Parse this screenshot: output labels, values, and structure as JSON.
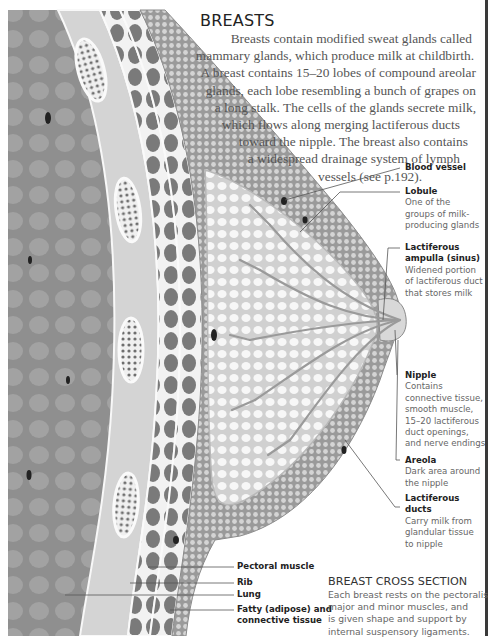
{
  "header": {
    "title": "BREASTS",
    "intro_lines": [
      "Breasts contain modified sweat glands called",
      "mammary glands, which produce milk at childbirth.",
      "A breast contains 15–20 lobes of compound areolar",
      "glands, each lobe resembling a bunch of grapes on",
      "a long stalk. The cells of the glands secrete milk,",
      "which flows along merging lactiferous ducts",
      "toward the nipple. The breast also contains",
      "a widespread drainage system of lymph",
      "vessels (see p.192)."
    ]
  },
  "labels_right": [
    {
      "title": "Blood vessel",
      "desc": []
    },
    {
      "title": "Lobule",
      "desc": [
        "One of the",
        "groups of milk-",
        "producing glands"
      ]
    },
    {
      "title_lines": [
        "Lactiferous",
        "ampulla (sinus)"
      ],
      "desc": [
        "Widened portion",
        "of lactiferous duct",
        "that stores milk"
      ]
    },
    {
      "title": "Nipple",
      "desc": [
        "Contains",
        "connective tissue,",
        "smooth muscle,",
        "15–20 lactiferous",
        "duct openings,",
        "and nerve endings"
      ]
    },
    {
      "title": "Areola",
      "desc": [
        "Dark area around",
        "the nipple"
      ]
    },
    {
      "title_lines": [
        "Lactiferous",
        "ducts"
      ],
      "desc": [
        "Carry milk from",
        "glandular tissue",
        "to nipple"
      ]
    }
  ],
  "labels_bottom": [
    {
      "title": "Pectoral muscle"
    },
    {
      "title": "Rib"
    },
    {
      "title": "Lung"
    },
    {
      "title_lines": [
        "Fatty (adipose) and",
        "connective tissue"
      ]
    }
  ],
  "caption": {
    "title": "BREAST CROSS SECTION",
    "lines": [
      "Each breast rests on the pectoralis",
      "major and minor muscles, and",
      "is given shape and support by",
      "internal suspensory ligaments."
    ]
  },
  "colors": {
    "lung": "#8f8f8f",
    "lung_cell": "#a3a3a3",
    "muscle_band": "#cfcfcf",
    "rib_cells": "#7a7a7a",
    "fat": "#b4b4b4",
    "gland_bg": "#d8d8d8",
    "gland_cell": "#f4f4f4",
    "rule": "#3a3a3a"
  }
}
